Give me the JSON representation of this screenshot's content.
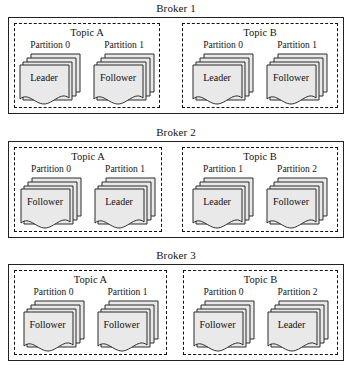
{
  "diagram": {
    "colors": {
      "document_fill": "#e9e9e9",
      "document_stroke": "#2b2b2b",
      "broker_border": "#222222",
      "topic_border": "#111111",
      "page_background": "#ffffff",
      "text": "#141414"
    },
    "brokers": [
      {
        "label": "Broker 1",
        "topics": [
          {
            "label": "Topic A",
            "partitions": [
              {
                "label": "Partition 0",
                "role": "Leader"
              },
              {
                "label": "Partition 1",
                "role": "Follower"
              }
            ]
          },
          {
            "label": "Topic B",
            "partitions": [
              {
                "label": "Partition 0",
                "role": "Leader"
              },
              {
                "label": "Partition 1",
                "role": "Follower"
              }
            ]
          }
        ]
      },
      {
        "label": "Broker 2",
        "topics": [
          {
            "label": "Topic A",
            "partitions": [
              {
                "label": "Partition 0",
                "role": "Follower"
              },
              {
                "label": "Partition 1",
                "role": "Leader"
              }
            ]
          },
          {
            "label": "Topic B",
            "partitions": [
              {
                "label": "Partition 1",
                "role": "Leader"
              },
              {
                "label": "Partition 2",
                "role": "Follower"
              }
            ]
          }
        ]
      },
      {
        "label": "Broker 3",
        "topics": [
          {
            "label": "Topic A",
            "partitions": [
              {
                "label": "Partition 0",
                "role": "Follower"
              },
              {
                "label": "Partition 1",
                "role": "Follower"
              }
            ]
          },
          {
            "label": "Topic B",
            "partitions": [
              {
                "label": "Partition 0",
                "role": "Follower"
              },
              {
                "label": "Partition 2",
                "role": "Leader"
              }
            ]
          }
        ]
      }
    ]
  }
}
